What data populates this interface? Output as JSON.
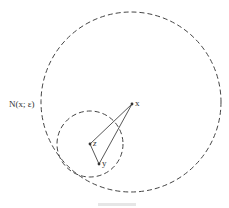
{
  "diagram": {
    "neighborhood_label": "N(x; ε)",
    "points": {
      "x": {
        "label": "x",
        "cx": 132,
        "cy": 104
      },
      "z": {
        "label": "z",
        "cx": 90,
        "cy": 144
      },
      "y": {
        "label": "y",
        "cx": 99,
        "cy": 164
      }
    },
    "large_circle": {
      "cx": 131,
      "cy": 102,
      "r": 90
    },
    "small_circle": {
      "cx": 90,
      "cy": 144,
      "r": 33
    },
    "caption": "Fig. —",
    "colors": {
      "stroke": "#444444",
      "text": "#333333"
    }
  }
}
